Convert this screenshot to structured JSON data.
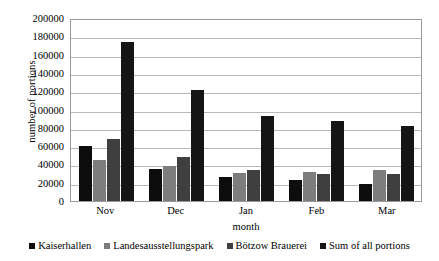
{
  "chart_data": {
    "type": "bar",
    "title": "",
    "xlabel": "month",
    "ylabel": "number of portions",
    "categories": [
      "Nov",
      "Dec",
      "Jan",
      "Feb",
      "Mar"
    ],
    "series": [
      {
        "name": "Kaiserhallen",
        "color": "#0d0d0d",
        "values": [
          60000,
          35000,
          26000,
          23000,
          19000
        ]
      },
      {
        "name": "Landesausstellungspark",
        "color": "#7d7d7d",
        "values": [
          45000,
          38000,
          31000,
          32000,
          34000
        ]
      },
      {
        "name": "Bötzow Brauerei",
        "color": "#3f3f3f",
        "values": [
          68000,
          48000,
          34000,
          30000,
          29000
        ]
      },
      {
        "name": "Sum of all portions",
        "color": "#151515",
        "values": [
          174000,
          121000,
          93000,
          87000,
          82000
        ]
      }
    ],
    "ylim": [
      0,
      200000
    ],
    "ytick_step": 20000,
    "yticks": [
      "0",
      "20000",
      "40000",
      "60000",
      "80000",
      "100000",
      "120000",
      "140000",
      "160000",
      "180000",
      "200000"
    ],
    "grid": true,
    "legend_position": "bottom"
  }
}
